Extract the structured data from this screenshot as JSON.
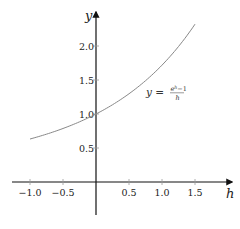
{
  "chart_data": {
    "type": "line",
    "title": "",
    "xlabel": "h",
    "ylabel": "y",
    "xlim": [
      -1.25,
      1.8
    ],
    "ylim": [
      -0.65,
      2.45
    ],
    "grid": false,
    "x_ticks": [
      -1.0,
      -0.5,
      0.5,
      1.0,
      1.5
    ],
    "x_tick_labels": [
      "−1.0",
      "−0.5",
      "0.5",
      "1.0",
      "1.5"
    ],
    "y_ticks": [
      0.5,
      1.0,
      1.5,
      2.0
    ],
    "y_tick_labels": [
      "0.5",
      "1.0",
      "1.5",
      "2.0"
    ],
    "series": [
      {
        "name": "y = (e^h - 1)/h",
        "function": "(exp(h)-1)/h",
        "x_range": [
          -1.0,
          1.5
        ],
        "x": [
          -1.0,
          -0.75,
          -0.5,
          -0.25,
          0.0,
          0.25,
          0.5,
          0.75,
          1.0,
          1.25,
          1.5
        ],
        "y": [
          0.632,
          0.703,
          0.787,
          0.885,
          1.0,
          1.136,
          1.297,
          1.489,
          1.718,
          1.993,
          2.321
        ],
        "color": "#888888"
      }
    ],
    "annotations": [
      {
        "text": "y = (e^h − 1)/h",
        "lhs": "y =",
        "numerator": "e",
        "numerator_sup": "h",
        "numerator_rest": "−1",
        "denominator": "h",
        "near": {
          "x": 1.0,
          "y": 1.35
        }
      }
    ],
    "axis_color": "#111111"
  }
}
